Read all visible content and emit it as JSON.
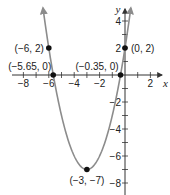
{
  "chart_data": {
    "type": "line",
    "title": "",
    "function": "y = (x + 3)^2 - 7",
    "xlabel": "x",
    "ylabel": "y",
    "xlim": [
      -9.8,
      3.5
    ],
    "ylim": [
      -9,
      5.5
    ],
    "grid": false,
    "x_ticks": [
      -8,
      -7,
      -6,
      -5,
      -4,
      -3,
      -2,
      -1,
      0,
      1,
      2
    ],
    "x_tick_labels": [
      {
        "value": -8,
        "label": "−8"
      },
      {
        "value": -6,
        "label": "−6"
      },
      {
        "value": -4,
        "label": "−4"
      },
      {
        "value": -2,
        "label": "−2"
      },
      {
        "value": 2,
        "label": "2"
      }
    ],
    "y_ticks": [
      -8,
      -7,
      -6,
      -5,
      -4,
      -3,
      -2,
      -1,
      1,
      2,
      3,
      4
    ],
    "y_tick_labels": [
      {
        "value": 4,
        "label": "4"
      },
      {
        "value": 2,
        "label": "2"
      },
      {
        "value": -2,
        "label": "−2"
      },
      {
        "value": -4,
        "label": "−4"
      },
      {
        "value": -6,
        "label": "−6"
      },
      {
        "value": -8,
        "label": "−8"
      }
    ],
    "curve": {
      "x_range": [
        -6.46,
        0.46
      ],
      "color": "#8c8c8c",
      "arrows_at_ends": true
    },
    "points": [
      {
        "x": -6,
        "y": 2,
        "label": "(−6, 2)",
        "label_pos": "left"
      },
      {
        "x": 0,
        "y": 2,
        "label": "(0, 2)",
        "label_pos": "right"
      },
      {
        "x": -5.65,
        "y": 0,
        "label": "(−5.65, 0)",
        "label_pos": "above-left"
      },
      {
        "x": -0.35,
        "y": 0,
        "label": "(−0.35, 0)",
        "label_pos": "above-left"
      },
      {
        "x": -3,
        "y": -7,
        "label": "(−3, −7)",
        "label_pos": "below"
      }
    ],
    "colors": {
      "axis": "#333333",
      "curve": "#8c8c8c",
      "point": "#111111"
    }
  }
}
